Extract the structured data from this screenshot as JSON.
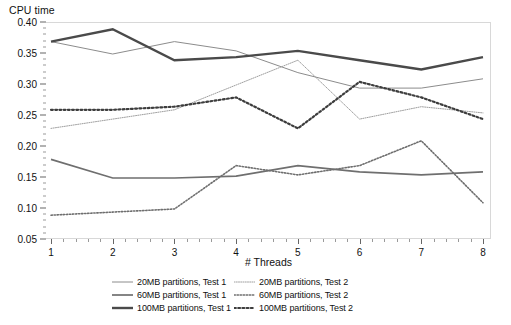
{
  "chart_data": {
    "type": "line",
    "title": "",
    "ylabel": "CPU time",
    "xlabel": "# Threads",
    "categories": [
      1,
      2,
      3,
      4,
      5,
      6,
      7,
      8
    ],
    "x": [
      1,
      2,
      3,
      4,
      5,
      6,
      7,
      8
    ],
    "ylim": [
      0.05,
      0.4
    ],
    "xlim": [
      1,
      8
    ],
    "ytick_labels": [
      "0.40",
      "0.35",
      "0.30",
      "0.25",
      "0.20",
      "0.15",
      "0.10",
      "0.05"
    ],
    "ytick_values": [
      0.4,
      0.35,
      0.3,
      0.25,
      0.2,
      0.15,
      0.1,
      0.05
    ],
    "xtick_labels": [
      "1",
      "2",
      "3",
      "4",
      "5",
      "6",
      "7",
      "8"
    ],
    "grid": false,
    "legend_position": "bottom",
    "series": [
      {
        "name": "20MB partitions, Test 1",
        "style": "solid",
        "width": 1.0,
        "color": "#8c8c8c",
        "values": [
          0.37,
          0.35,
          0.37,
          0.355,
          0.32,
          0.295,
          0.295,
          0.31
        ]
      },
      {
        "name": "60MB partitions, Test 1",
        "style": "solid",
        "width": 1.7,
        "color": "#6f6f6f",
        "values": [
          0.18,
          0.15,
          0.15,
          0.153,
          0.17,
          0.16,
          0.155,
          0.16
        ]
      },
      {
        "name": "100MB partitions, Test 1",
        "style": "solid",
        "width": 2.4,
        "color": "#4a4a4a",
        "values": [
          0.37,
          0.39,
          0.34,
          0.345,
          0.355,
          0.34,
          0.325,
          0.345
        ]
      },
      {
        "name": "20MB partitions, Test 2",
        "style": "dotted",
        "width": 1.0,
        "color": "#9f9f9f",
        "values": [
          0.23,
          0.245,
          0.26,
          0.3,
          0.34,
          0.245,
          0.265,
          0.255
        ]
      },
      {
        "name": "60MB partitions, Test 2",
        "style": "dotted",
        "width": 1.6,
        "color": "#6f6f6f",
        "values": [
          0.09,
          0.095,
          0.1,
          0.17,
          0.155,
          0.17,
          0.21,
          0.11
        ]
      },
      {
        "name": "100MB partitions, Test 2",
        "style": "dotted",
        "width": 2.2,
        "color": "#3d3d3d",
        "values": [
          0.26,
          0.26,
          0.265,
          0.28,
          0.23,
          0.305,
          0.28,
          0.245
        ]
      }
    ],
    "legend_entries": [
      "20MB partitions, Test 1",
      "20MB partitions, Test 2",
      "60MB partitions, Test 1",
      "60MB partitions, Test 2",
      "100MB partitions, Test 1",
      "100MB partitions, Test 2"
    ]
  }
}
